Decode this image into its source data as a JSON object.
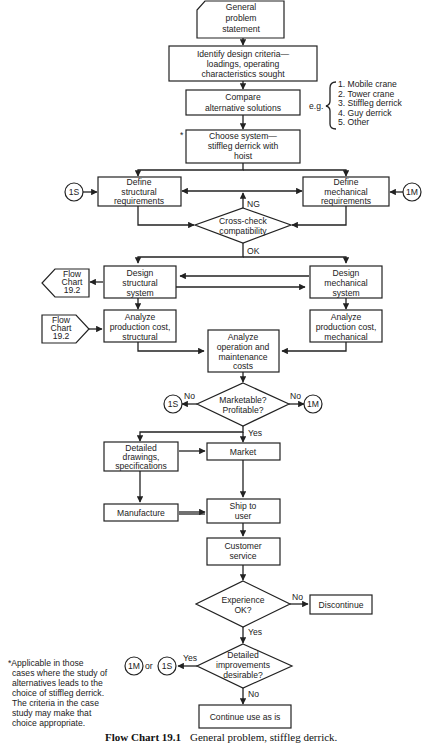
{
  "diagram": {
    "nodes": {
      "start": [
        "General",
        "problem",
        "statement"
      ],
      "identify": [
        "Identify design criteria—",
        "loadings, operating",
        "characteristics sought"
      ],
      "compare": [
        "Compare",
        "alternative solutions"
      ],
      "choose": [
        "Choose system—",
        "stiffleg derrick with",
        "hoist"
      ],
      "def_struct": [
        "Define",
        "structural",
        "requirements"
      ],
      "def_mech": [
        "Define",
        "mechanical",
        "requirements"
      ],
      "crosscheck": [
        "Cross-check",
        "compatibility"
      ],
      "design_struct": [
        "Design",
        "structural",
        "system"
      ],
      "design_mech": [
        "Design",
        "mechanical",
        "system"
      ],
      "prod_struct": [
        "Analyze",
        "production cost,",
        "structural"
      ],
      "prod_mech": [
        "Analyze",
        "production cost,",
        "mechanical"
      ],
      "op_maint": [
        "Analyze",
        "operation and",
        "maintenance",
        "costs"
      ],
      "marketable": [
        "Marketable?",
        "Profitable?"
      ],
      "drawings": [
        "Detailed",
        "drawings,",
        "specifications"
      ],
      "market": [
        "Market"
      ],
      "manufacture": [
        "Manufacture"
      ],
      "ship": [
        "Ship to",
        "user"
      ],
      "service": [
        "Customer",
        "service"
      ],
      "experience": [
        "Experience",
        "OK?"
      ],
      "discontinue": [
        "Discontinue"
      ],
      "improvements": [
        "Detailed",
        "improvements",
        "desirable?"
      ],
      "continue": [
        "Continue use as is"
      ],
      "flow_out": [
        "Flow",
        "Chart",
        "19.2"
      ],
      "flow_in": [
        "Flow",
        "Chart",
        "19.2"
      ]
    },
    "connectors": {
      "c1s": "1S",
      "c1m": "1M",
      "or_text": "or"
    },
    "edge_labels": {
      "ng": "NG",
      "ok": "OK",
      "no": "No",
      "yes": "Yes"
    },
    "alternatives": {
      "prefix": "e.g.",
      "items": [
        "1. Mobile crane",
        "2. Tower crane",
        "3. Stiffleg derrick",
        "4. Guy derrick",
        "5. Other"
      ]
    },
    "asterisk": "*",
    "footnote": [
      "*Applicable in those",
      "cases where the study of",
      "alternatives leads to the",
      "choice of stiffleg derrick.",
      "The criteria in the case",
      "study may make that",
      "choice appropriate."
    ],
    "caption": {
      "label": "Flow Chart 19.1",
      "text": "General problem, stiffleg derrick."
    }
  }
}
